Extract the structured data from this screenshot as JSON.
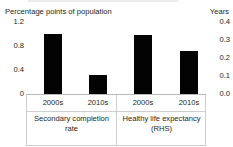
{
  "chart_data": {
    "type": "bar",
    "title": "",
    "categories": [
      "2000s",
      "2010s",
      "2000s",
      "2010s"
    ],
    "groups": [
      {
        "label_line1": "Secondary completion",
        "label_line2": "rate",
        "axis": "left"
      },
      {
        "label_line1": "Healthy life expectancy",
        "label_line2": "(RHS)",
        "axis": "right"
      }
    ],
    "series": [
      {
        "name": "Secondary completion rate",
        "axis": "left",
        "unit": "Percentage points of population",
        "points": [
          {
            "category": "2000s",
            "value": 1.0
          },
          {
            "category": "2010s",
            "value": 0.32
          }
        ]
      },
      {
        "name": "Healthy life expectancy (RHS)",
        "axis": "right",
        "unit": "Years",
        "points": [
          {
            "category": "2000s",
            "value": 0.33
          },
          {
            "category": "2010s",
            "value": 0.24
          }
        ]
      }
    ],
    "bars": [
      {
        "label": "2000s",
        "value": 1.0,
        "axis": "left",
        "group": "Secondary completion rate"
      },
      {
        "label": "2010s",
        "value": 0.32,
        "axis": "left",
        "group": "Secondary completion rate"
      },
      {
        "label": "2000s",
        "value": 0.33,
        "axis": "right",
        "group": "Healthy life expectancy (RHS)"
      },
      {
        "label": "2010s",
        "value": 0.24,
        "axis": "right",
        "group": "Healthy life expectancy (RHS)"
      }
    ],
    "left_axis": {
      "title": "Percentage points of population",
      "ticks": [
        "1.2",
        "0.8",
        "0.4",
        "0"
      ],
      "tick_values": [
        1.2,
        0.8,
        0.4,
        0
      ],
      "ylim": [
        0,
        1.2
      ]
    },
    "right_axis": {
      "title": "Years",
      "ticks": [
        "0.4",
        "0.3",
        "0.2",
        "0.1",
        "0.0"
      ],
      "tick_values": [
        0.4,
        0.3,
        0.2,
        0.1,
        0.0
      ],
      "ylim": [
        0,
        0.4
      ]
    },
    "xlabel": "",
    "grid": false,
    "legend": "none",
    "bar_color": "#030303"
  }
}
